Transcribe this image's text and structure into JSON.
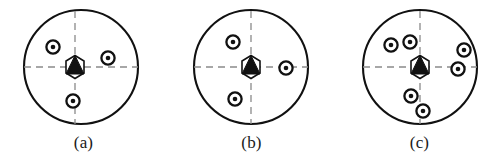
{
  "figure": {
    "name": "three-circular-sensor-layout-panels",
    "background_color": "#ffffff",
    "stroke_color": "#111111",
    "dashed_color": "#8a8a8a",
    "width": 503,
    "height": 167
  },
  "marker_legend": {
    "center_marker": "hexagon-with-filled-triangle",
    "node_marker": "concentric-ring-with-dot"
  },
  "panels": [
    {
      "id": "panel-a",
      "caption": "(a)",
      "origin_x": 0,
      "boundary": {
        "cx": 81,
        "cy": 67,
        "r": 57
      },
      "axes": {
        "horizontal_y": 67,
        "vertical_x": 75
      },
      "center_marker": {
        "cx": 75,
        "cy": 67,
        "size": 17
      },
      "nodes": [
        {
          "cx": 53,
          "cy": 47,
          "r": 7
        },
        {
          "cx": 108,
          "cy": 58,
          "r": 7
        },
        {
          "cx": 73,
          "cy": 101,
          "r": 7
        }
      ]
    },
    {
      "id": "panel-b",
      "caption": "(b)",
      "origin_x": 168,
      "boundary": {
        "cx": 251,
        "cy": 67,
        "r": 57
      },
      "axes": {
        "horizontal_y": 67,
        "vertical_x": 251
      },
      "center_marker": {
        "cx": 251,
        "cy": 67,
        "size": 17
      },
      "nodes": [
        {
          "cx": 233,
          "cy": 42,
          "r": 7
        },
        {
          "cx": 286,
          "cy": 68,
          "r": 7
        },
        {
          "cx": 235,
          "cy": 99,
          "r": 7
        }
      ]
    },
    {
      "id": "panel-c",
      "caption": "(c)",
      "origin_x": 336,
      "boundary": {
        "cx": 420,
        "cy": 67,
        "r": 57
      },
      "axes": {
        "horizontal_y": 67,
        "vertical_x": 420
      },
      "center_marker": {
        "cx": 420,
        "cy": 67,
        "size": 17
      },
      "nodes": [
        {
          "cx": 391,
          "cy": 45,
          "r": 7
        },
        {
          "cx": 410,
          "cy": 42,
          "r": 7
        },
        {
          "cx": 464,
          "cy": 50,
          "r": 7
        },
        {
          "cx": 458,
          "cy": 69,
          "r": 7
        },
        {
          "cx": 411,
          "cy": 96,
          "r": 7
        },
        {
          "cx": 423,
          "cy": 111,
          "r": 7
        }
      ]
    }
  ]
}
